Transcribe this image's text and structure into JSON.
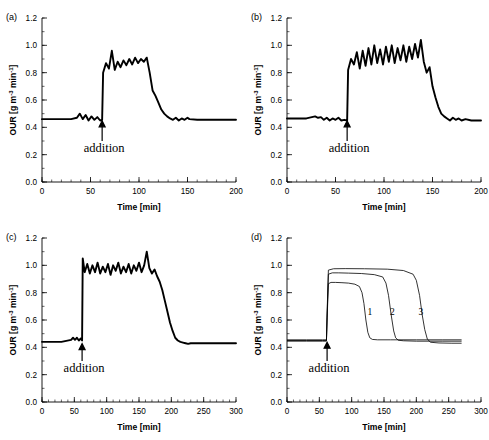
{
  "figure": {
    "panels": [
      "a",
      "b",
      "c",
      "d"
    ],
    "axis_titles": {
      "x": "Time [min]",
      "y_prefix": "OUR [g m",
      "y_exp1": "-3",
      "y_mid": " min",
      "y_exp2": "-1",
      "y_suffix": "]"
    },
    "annotation": "addition"
  },
  "chart_data": [
    {
      "id": "a",
      "type": "line",
      "panel_label": "(a)",
      "title": "",
      "xlabel": "Time [min]",
      "ylabel": "OUR [g m-3 min-1]",
      "xlim": [
        0,
        200
      ],
      "ylim": [
        0.0,
        1.2
      ],
      "xticks": [
        0,
        50,
        100,
        150,
        200
      ],
      "yticks": [
        0.0,
        0.2,
        0.4,
        0.6,
        0.8,
        1.0,
        1.2
      ],
      "xtick_minor_step": 10,
      "grid": false,
      "legend": "none",
      "annotations": [
        {
          "text": "addition",
          "x": 62,
          "y": 0.22,
          "arrow_x": 62,
          "arrow_y0": 0.3,
          "arrow_y1": 0.44
        }
      ],
      "series": [
        {
          "name": "OUR measured",
          "noisy": true,
          "baseline": 0.46,
          "plateau": 0.855,
          "addition_time": 62,
          "noise_start": 36,
          "noise_end": 152,
          "plateau_start": 63,
          "plateau_end": 108,
          "fall_end": 122,
          "tail_level": 0.455,
          "noise_amp": 0.055,
          "x": [
            0,
            10,
            20,
            30,
            36,
            39,
            42,
            45,
            48,
            51,
            54,
            57,
            60,
            62,
            63,
            66,
            69,
            72,
            75,
            78,
            81,
            84,
            87,
            90,
            93,
            96,
            99,
            102,
            105,
            108,
            111,
            114,
            117,
            120,
            123,
            126,
            129,
            132,
            135,
            138,
            141,
            144,
            147,
            150,
            152,
            160,
            175,
            200
          ],
          "y": [
            0.46,
            0.46,
            0.46,
            0.46,
            0.47,
            0.5,
            0.46,
            0.49,
            0.45,
            0.48,
            0.455,
            0.475,
            0.45,
            0.455,
            0.8,
            0.87,
            0.83,
            0.96,
            0.82,
            0.88,
            0.84,
            0.89,
            0.855,
            0.9,
            0.86,
            0.91,
            0.87,
            0.9,
            0.88,
            0.91,
            0.8,
            0.67,
            0.63,
            0.58,
            0.53,
            0.5,
            0.48,
            0.465,
            0.455,
            0.47,
            0.45,
            0.465,
            0.455,
            0.47,
            0.46,
            0.455,
            0.455,
            0.455
          ]
        }
      ]
    },
    {
      "id": "b",
      "type": "line",
      "panel_label": "(b)",
      "title": "",
      "xlabel": "Time [min]",
      "ylabel": "OUR [g m-3 min-1]",
      "xlim": [
        0,
        200
      ],
      "ylim": [
        0.0,
        1.2
      ],
      "xticks": [
        0,
        50,
        100,
        150,
        200
      ],
      "yticks": [
        0.0,
        0.2,
        0.4,
        0.6,
        0.8,
        1.0,
        1.2
      ],
      "xtick_minor_step": 10,
      "grid": false,
      "legend": "none",
      "annotations": [
        {
          "text": "addition",
          "x": 62,
          "y": 0.22,
          "arrow_x": 62,
          "arrow_y0": 0.3,
          "arrow_y1": 0.44
        }
      ],
      "series": [
        {
          "name": "OUR measured",
          "noisy": true,
          "baseline": 0.465,
          "plateau": 0.93,
          "addition_time": 62,
          "noise_start": 29,
          "noise_end": 184,
          "plateau_start": 63,
          "plateau_end": 144,
          "fall_end": 158,
          "tail_level": 0.45,
          "noise_amp": 0.09,
          "x": [
            0,
            10,
            20,
            29,
            32,
            35,
            38,
            41,
            44,
            47,
            50,
            53,
            56,
            59,
            62,
            63,
            66,
            69,
            72,
            75,
            78,
            81,
            84,
            87,
            90,
            93,
            96,
            99,
            102,
            105,
            108,
            111,
            114,
            117,
            120,
            123,
            126,
            129,
            132,
            135,
            138,
            141,
            144,
            147,
            150,
            153,
            156,
            159,
            162,
            165,
            168,
            171,
            174,
            177,
            180,
            184,
            190,
            200
          ],
          "y": [
            0.465,
            0.465,
            0.465,
            0.48,
            0.47,
            0.475,
            0.455,
            0.47,
            0.45,
            0.465,
            0.455,
            0.47,
            0.45,
            0.455,
            0.45,
            0.82,
            0.9,
            0.86,
            0.95,
            0.83,
            0.96,
            0.85,
            0.98,
            0.86,
            1.0,
            0.87,
            0.97,
            0.86,
            0.99,
            0.88,
            1.0,
            0.87,
            0.98,
            0.89,
            1.0,
            0.88,
            0.99,
            0.9,
            1.01,
            0.91,
            1.04,
            0.88,
            0.8,
            0.84,
            0.7,
            0.62,
            0.55,
            0.5,
            0.48,
            0.465,
            0.45,
            0.47,
            0.455,
            0.465,
            0.45,
            0.46,
            0.45,
            0.45
          ]
        }
      ]
    },
    {
      "id": "c",
      "type": "line",
      "panel_label": "(c)",
      "title": "",
      "xlabel": "Time [min]",
      "ylabel": "OUR [g m-3 min-1]",
      "xlim": [
        0,
        300
      ],
      "ylim": [
        0.0,
        1.2
      ],
      "xticks": [
        0,
        50,
        100,
        150,
        200,
        250,
        300
      ],
      "yticks": [
        0.0,
        0.2,
        0.4,
        0.6,
        0.8,
        1.0,
        1.2
      ],
      "xtick_minor_step": 10,
      "grid": false,
      "legend": "none",
      "annotations": [
        {
          "text": "addition",
          "x": 62,
          "y": 0.22,
          "arrow_x": 62,
          "arrow_y0": 0.3,
          "arrow_y1": 0.42
        }
      ],
      "series": [
        {
          "name": "OUR measured",
          "noisy": true,
          "baseline": 0.44,
          "plateau": 0.985,
          "addition_time": 62,
          "noise_start": 45,
          "noise_end": 230,
          "plateau_start": 63,
          "plateau_end": 175,
          "fall_end": 205,
          "tail_level": 0.43,
          "noise_amp": 0.055,
          "x": [
            0,
            15,
            30,
            45,
            48,
            51,
            54,
            57,
            60,
            62,
            63,
            66,
            70,
            74,
            78,
            82,
            86,
            90,
            94,
            98,
            102,
            106,
            110,
            114,
            118,
            122,
            126,
            130,
            134,
            138,
            142,
            146,
            150,
            154,
            158,
            162,
            166,
            170,
            174,
            178,
            182,
            186,
            190,
            194,
            198,
            202,
            206,
            210,
            214,
            218,
            222,
            226,
            230,
            245,
            270,
            300
          ],
          "y": [
            0.44,
            0.44,
            0.44,
            0.455,
            0.47,
            0.455,
            0.47,
            0.45,
            0.465,
            0.45,
            1.05,
            0.95,
            1.01,
            0.94,
            1.0,
            0.95,
            1.02,
            0.94,
            0.99,
            0.95,
            1.01,
            0.93,
            1.0,
            0.96,
            1.02,
            0.94,
            0.99,
            0.95,
            1.01,
            0.94,
            1.0,
            0.96,
            1.02,
            0.95,
            1.0,
            1.1,
            0.98,
            0.94,
            0.97,
            0.92,
            0.88,
            0.82,
            0.74,
            0.66,
            0.58,
            0.52,
            0.47,
            0.45,
            0.44,
            0.435,
            0.43,
            0.425,
            0.43,
            0.43,
            0.43,
            0.43
          ]
        }
      ]
    },
    {
      "id": "d",
      "type": "line",
      "panel_label": "(d)",
      "title": "",
      "xlabel": "Time [min]",
      "ylabel": "OUR [g m-3 min-1]",
      "xlim": [
        0,
        300
      ],
      "ylim": [
        0.0,
        1.2
      ],
      "xticks": [
        0,
        50,
        100,
        150,
        200,
        250,
        300
      ],
      "yticks": [
        0.0,
        0.2,
        0.4,
        0.6,
        0.8,
        1.0,
        1.2
      ],
      "xtick_minor_step": 10,
      "grid": false,
      "legend": "inline-numbers",
      "annotations": [
        {
          "text": "addition",
          "x": 62,
          "y": 0.22,
          "arrow_x": 62,
          "arrow_y0": 0.3,
          "arrow_y1": 0.43
        }
      ],
      "series": [
        {
          "name": "1",
          "label": "1",
          "label_x": 128,
          "label_y": 0.64,
          "noisy": false,
          "baseline": 0.455,
          "plateau": 0.87,
          "addition_time": 62,
          "drop_time": 120,
          "tail_level": 0.455,
          "x": [
            0,
            30,
            55,
            61,
            62,
            64,
            68,
            75,
            85,
            95,
            105,
            112,
            116,
            119,
            122,
            125,
            128,
            132,
            140,
            160,
            200,
            240,
            270
          ],
          "y": [
            0.455,
            0.455,
            0.455,
            0.455,
            0.6,
            0.865,
            0.875,
            0.875,
            0.873,
            0.87,
            0.862,
            0.845,
            0.8,
            0.72,
            0.6,
            0.51,
            0.47,
            0.458,
            0.455,
            0.455,
            0.455,
            0.455,
            0.455
          ]
        },
        {
          "name": "2",
          "label": "2",
          "label_x": 163,
          "label_y": 0.64,
          "noisy": false,
          "baseline": 0.45,
          "plateau": 0.94,
          "addition_time": 62,
          "drop_time": 158,
          "tail_level": 0.445,
          "x": [
            0,
            30,
            55,
            61,
            62,
            64,
            70,
            80,
            95,
            115,
            135,
            148,
            153,
            157,
            161,
            165,
            168,
            172,
            180,
            200,
            240,
            270
          ],
          "y": [
            0.45,
            0.45,
            0.45,
            0.45,
            0.62,
            0.935,
            0.945,
            0.945,
            0.943,
            0.94,
            0.932,
            0.915,
            0.87,
            0.78,
            0.64,
            0.52,
            0.47,
            0.452,
            0.448,
            0.445,
            0.445,
            0.445
          ]
        },
        {
          "name": "3",
          "label": "3",
          "label_x": 207,
          "label_y": 0.64,
          "noisy": false,
          "baseline": 0.445,
          "plateau": 0.972,
          "addition_time": 62,
          "drop_time": 205,
          "tail_level": 0.43,
          "x": [
            0,
            30,
            55,
            61,
            62,
            64,
            72,
            90,
            120,
            155,
            180,
            195,
            200,
            205,
            209,
            213,
            217,
            222,
            235,
            255,
            270
          ],
          "y": [
            0.445,
            0.445,
            0.445,
            0.445,
            0.65,
            0.965,
            0.975,
            0.976,
            0.975,
            0.972,
            0.962,
            0.935,
            0.89,
            0.78,
            0.64,
            0.53,
            0.46,
            0.437,
            0.432,
            0.43,
            0.43
          ]
        }
      ]
    }
  ]
}
